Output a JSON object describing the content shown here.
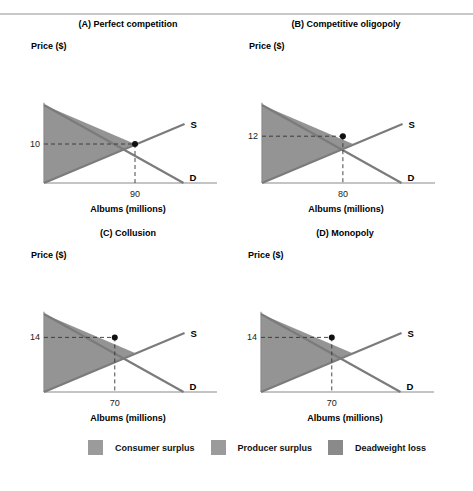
{
  "chart_data": [
    {
      "type": "area",
      "title": "(A) Perfect competition",
      "ylabel": "Price ($)",
      "xlabel": "Albums (millions)",
      "curves": {
        "supply_label": "S",
        "demand_label": "D"
      },
      "point": {
        "quantity": 90,
        "price": 10,
        "quantity_label": "90",
        "price_label": "10"
      },
      "equilibrium": {
        "quantity": 90,
        "price": 10
      },
      "regions": [
        "Consumer surplus",
        "Producer surplus"
      ]
    },
    {
      "type": "area",
      "title": "(B) Competitive oligopoly",
      "ylabel": "Price ($)",
      "xlabel": "Albums (millions)",
      "curves": {
        "supply_label": "S",
        "demand_label": "D"
      },
      "point": {
        "quantity": 80,
        "price": 12,
        "quantity_label": "80",
        "price_label": "12"
      },
      "equilibrium": {
        "quantity": 90,
        "price": 10
      },
      "regions": [
        "Consumer surplus",
        "Producer surplus",
        "Deadweight loss"
      ]
    },
    {
      "type": "area",
      "title": "(C) Collusion",
      "ylabel": "Price ($)",
      "xlabel": "Albums (millions)",
      "curves": {
        "supply_label": "S",
        "demand_label": "D"
      },
      "point": {
        "quantity": 70,
        "price": 14,
        "quantity_label": "70",
        "price_label": "14"
      },
      "equilibrium": {
        "quantity": 90,
        "price": 10
      },
      "regions": [
        "Consumer surplus",
        "Producer surplus",
        "Deadweight loss"
      ]
    },
    {
      "type": "area",
      "title": "(D) Monopoly",
      "ylabel": "Price ($)",
      "xlabel": "Albums (millions)",
      "curves": {
        "supply_label": "S",
        "demand_label": "D"
      },
      "point": {
        "quantity": 70,
        "price": 14,
        "quantity_label": "70",
        "price_label": "14"
      },
      "equilibrium": {
        "quantity": 90,
        "price": 10
      },
      "regions": [
        "Consumer surplus",
        "Producer surplus",
        "Deadweight loss"
      ]
    }
  ],
  "legend": [
    {
      "label": "Consumer surplus",
      "color": "#9b9b9b"
    },
    {
      "label": "Producer surplus",
      "color": "#9b9b9b"
    },
    {
      "label": "Deadweight loss",
      "color": "#8a8a8a"
    }
  ],
  "colors": {
    "fill": "#8e8e8e",
    "line": "#7b7b7b",
    "axis": "#8a8a8a",
    "dot": "#111111"
  }
}
